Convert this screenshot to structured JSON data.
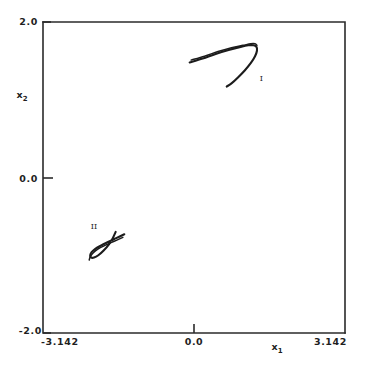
{
  "chart_data": {
    "type": "line",
    "title": "",
    "xlabel": "x_1",
    "ylabel": "x_2",
    "xlabel_base": "x",
    "xlabel_sub": "1",
    "ylabel_base": "x",
    "ylabel_sub": "2",
    "xlim": [
      -3.142,
      3.142
    ],
    "ylim": [
      -2.0,
      2.0
    ],
    "grid": false,
    "legend": "none",
    "xticks": [
      -3.142,
      0.0,
      3.142
    ],
    "xtick_labels": [
      "-3.142",
      "0.0",
      "3.142"
    ],
    "yticks": [
      -2.0,
      0.0,
      2.0
    ],
    "ytick_labels": [
      "-2.0",
      "0.0",
      "2.0"
    ],
    "series": [
      {
        "name": "I",
        "annotation": "I",
        "annotation_xy": [
          1.4,
          1.24
        ],
        "description": "upper-right folded branch with cusp",
        "x": [
          -0.09,
          0.18,
          0.45,
          0.72,
          0.97,
          1.13,
          1.24,
          1.3,
          1.31,
          1.27,
          1.18,
          1.06,
          0.92,
          0.78,
          0.68
        ],
        "y": [
          1.48,
          1.53,
          1.59,
          1.64,
          1.68,
          1.7,
          1.7,
          1.68,
          1.63,
          1.56,
          1.47,
          1.38,
          1.29,
          1.21,
          1.17
        ]
      },
      {
        "name": "I-upper-overlap",
        "annotation": "",
        "description": "second nearly-coincident sheet of branch I",
        "x": [
          -0.06,
          0.22,
          0.5,
          0.78,
          1.02,
          1.18,
          1.27,
          1.31
        ],
        "y": [
          1.51,
          1.56,
          1.62,
          1.67,
          1.7,
          1.72,
          1.72,
          1.7
        ]
      },
      {
        "name": "II",
        "annotation": "II",
        "annotation_xy": [
          -2.08,
          -0.66
        ],
        "description": "lower-left folded branch with cusp, mirror of I",
        "x": [
          -1.45,
          -1.62,
          -1.79,
          -1.95,
          -2.06,
          -2.13,
          -2.16,
          -2.14,
          -2.08,
          -1.99,
          -1.88,
          -1.77,
          -1.69,
          -1.63
        ],
        "y": [
          -0.73,
          -0.78,
          -0.83,
          -0.88,
          -0.92,
          -0.96,
          -1.0,
          -1.03,
          -1.03,
          -1.0,
          -0.94,
          -0.86,
          -0.78,
          -0.7
        ]
      },
      {
        "name": "II-lower-overlap",
        "annotation": "",
        "description": "second nearly-coincident sheet of branch II",
        "x": [
          -1.48,
          -1.66,
          -1.84,
          -2.0,
          -2.1,
          -2.16,
          -2.18
        ],
        "y": [
          -0.77,
          -0.82,
          -0.87,
          -0.92,
          -0.97,
          -1.02,
          -1.06
        ]
      }
    ]
  },
  "style": {
    "line_color": "#1c1c1c",
    "axis_color": "#2b2b2b",
    "background": "#ffffff"
  }
}
